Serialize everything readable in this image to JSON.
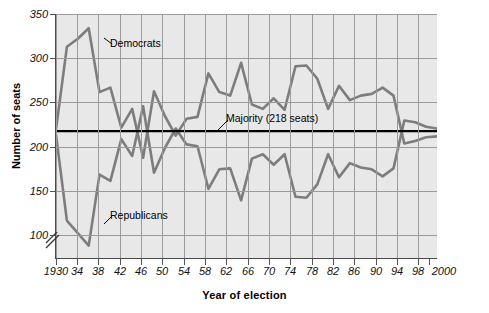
{
  "chart_data": {
    "type": "line",
    "title": "",
    "xlabel": "Year of election",
    "ylabel": "Number of seats",
    "xlim": [
      1930,
      2000
    ],
    "ylim": [
      75,
      350
    ],
    "grid": true,
    "axis_break": true,
    "legend_position": "inline-annotations",
    "xticks": [
      1930,
      1934,
      1938,
      1942,
      1946,
      1950,
      1954,
      1958,
      1962,
      1966,
      1970,
      1974,
      1978,
      1982,
      1986,
      1990,
      1994,
      1998,
      2000
    ],
    "xtick_labels": [
      "1930",
      "34",
      "38",
      "42",
      "46",
      "50",
      "54",
      "58",
      "62",
      "66",
      "70",
      "74",
      "78",
      "82",
      "86",
      "90",
      "94",
      "98",
      "2000"
    ],
    "yticks": [
      100,
      150,
      200,
      250,
      300,
      350
    ],
    "ytick_labels": [
      "100",
      "150",
      "200",
      "250",
      "300",
      "350"
    ],
    "x": [
      1930,
      1932,
      1934,
      1936,
      1938,
      1940,
      1942,
      1944,
      1946,
      1948,
      1950,
      1952,
      1954,
      1956,
      1958,
      1960,
      1962,
      1964,
      1966,
      1968,
      1970,
      1972,
      1974,
      1976,
      1978,
      1980,
      1982,
      1984,
      1986,
      1988,
      1990,
      1992,
      1994,
      1996,
      1998,
      2000
    ],
    "series": [
      {
        "name": "Democrats",
        "color": "#7d7d7d",
        "values": [
          220,
          313,
          322,
          334,
          262,
          267,
          222,
          243,
          188,
          263,
          235,
          213,
          232,
          234,
          283,
          262,
          258,
          295,
          248,
          243,
          255,
          242,
          291,
          292,
          277,
          243,
          269,
          253,
          258,
          260,
          267,
          258,
          204,
          207,
          211,
          212
        ]
      },
      {
        "name": "Republicans",
        "color": "#7d7d7d",
        "values": [
          214,
          117,
          103,
          89,
          169,
          162,
          209,
          190,
          246,
          171,
          199,
          221,
          203,
          201,
          153,
          175,
          176,
          140,
          187,
          192,
          180,
          192,
          144,
          143,
          158,
          192,
          166,
          182,
          177,
          175,
          167,
          176,
          230,
          228,
          223,
          221
        ]
      }
    ],
    "reference_line": {
      "label": "Majority (218 seats)",
      "value": 218,
      "color": "#000000"
    },
    "annotations": [
      {
        "text": "Democrats",
        "series": "Democrats"
      },
      {
        "text": "Republicans",
        "series": "Republicans"
      },
      {
        "text": "Majority (218 seats)",
        "series": "reference"
      }
    ]
  }
}
